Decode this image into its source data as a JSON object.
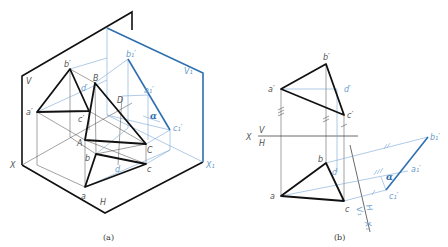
{
  "figure_a": {
    "caption": "(a)",
    "planes": {
      "V": "V",
      "H": "H",
      "V1": "V₁"
    },
    "axes": {
      "X": "X",
      "X1": "X₁"
    },
    "points_space": {
      "A": "A",
      "B": "B",
      "C": "C",
      "D": "D"
    },
    "points_v": {
      "a": "a′",
      "b": "b′",
      "c": "c′",
      "d": "d′"
    },
    "points_h": {
      "a": "a",
      "b": "b",
      "c": "c",
      "d": "d"
    },
    "points_v1": {
      "a": "a₁′",
      "b": "b₁′",
      "c": "c₁′"
    },
    "angle": "α"
  },
  "figure_b": {
    "caption": "(b)",
    "axis": {
      "X": "X",
      "V": "V",
      "H": "H"
    },
    "axis1": {
      "H": "H",
      "V1": "V₁",
      "X1": "X₁"
    },
    "points_v": {
      "a": "a′",
      "b": "b′",
      "c": "c′",
      "d": "d′"
    },
    "points_h": {
      "a": "a",
      "b": "b",
      "c": "c",
      "d": "d"
    },
    "points_v1": {
      "a": "a₁′",
      "b": "b₁′",
      "c": "c₁′"
    },
    "angle": "α"
  },
  "colors": {
    "line": "#111111",
    "thin": "#444444",
    "aux_blue": "#7aa8d6",
    "result_blue": "#2f6faf"
  }
}
